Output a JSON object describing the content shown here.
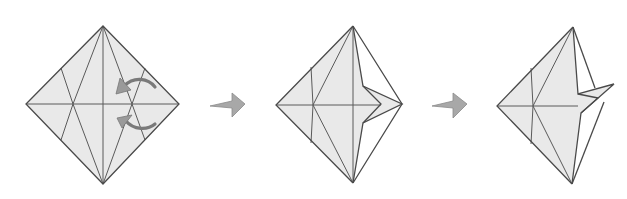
{
  "diagram": {
    "type": "origami-sequence",
    "steps": [
      {
        "id": "step-1",
        "description": "Square base with creases; two curved arrows indicate folding right flaps inward"
      },
      {
        "id": "step-2",
        "description": "Right side folded in, forming a notch pointing to the right"
      },
      {
        "id": "step-3",
        "description": "Flap lifted upward to the right"
      }
    ],
    "transitions": [
      {
        "from": "step-1",
        "to": "step-2",
        "icon": "right-arrow-icon"
      },
      {
        "from": "step-2",
        "to": "step-3",
        "icon": "right-arrow-icon"
      }
    ],
    "colors": {
      "paper": "#e9e9e9",
      "lines": "#4a4a4a",
      "arrows": "#a8a8a8",
      "curved_arrows": "#7a7a7a",
      "background": "#ffffff"
    }
  }
}
